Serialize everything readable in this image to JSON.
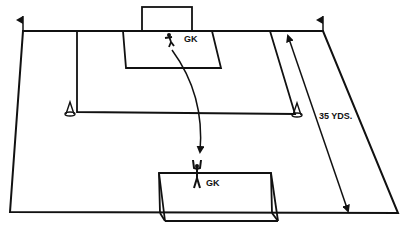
{
  "diagram": {
    "type": "soccer-field-drill",
    "line_color": "#111111",
    "background": "#ffffff",
    "labels": {
      "top_goalkeeper": "GK",
      "bottom_goalkeeper": "GK",
      "distance": "35 YDS."
    },
    "elements": [
      "corner-flag-left",
      "corner-flag-right",
      "top-goal",
      "penalty-box",
      "inner-grid-line",
      "cone-left",
      "cone-right",
      "distance-arrow",
      "gk-movement-arrow",
      "bottom-goal",
      "goalkeeper-top",
      "goalkeeper-bottom"
    ]
  }
}
